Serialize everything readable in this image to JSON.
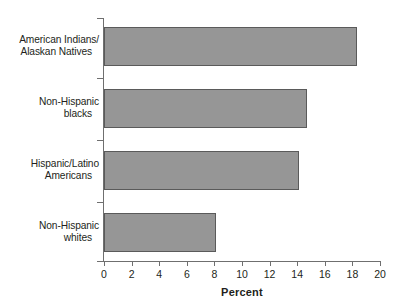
{
  "chart_data": {
    "type": "bar",
    "orientation": "horizontal",
    "title": "",
    "xlabel": "Percent",
    "ylabel": "",
    "xlim": [
      0,
      20
    ],
    "xticks": [
      0,
      2,
      4,
      6,
      8,
      10,
      12,
      14,
      16,
      18,
      20
    ],
    "xtick_labels": [
      "0",
      "2",
      "4",
      "6",
      "8",
      "10",
      "12",
      "14",
      "16",
      "18",
      "20"
    ],
    "grid": false,
    "legend": false,
    "categories": [
      "American Indians/\nAlaskan Natives",
      "Non-Hispanic\nblacks",
      "Hispanic/Latino\nAmericans",
      "Non-Hispanic\nwhites"
    ],
    "values": [
      18.3,
      14.7,
      14.1,
      8.1
    ],
    "bar_color": "#969696",
    "bar_edge_color": "#5a5a5a",
    "axis_color": "#6f6f6f",
    "text_color": "#231f20",
    "background": "#ffffff"
  },
  "categories": [
    {
      "line1": "American Indians/",
      "line2": "Alaskan Natives"
    },
    {
      "line1": "Non-Hispanic",
      "line2": "blacks"
    },
    {
      "line1": "Hispanic/Latino",
      "line2": "Americans"
    },
    {
      "line1": "Non-Hispanic",
      "line2": "whites"
    }
  ],
  "axis": {
    "x_title": "Percent",
    "ticks": [
      "0",
      "2",
      "4",
      "6",
      "8",
      "10",
      "12",
      "14",
      "16",
      "18",
      "20"
    ]
  }
}
